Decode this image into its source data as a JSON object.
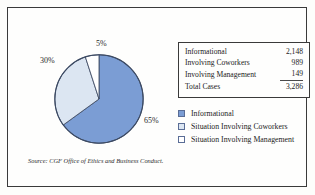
{
  "figure": {
    "source_note": "Source: CGF Office of Ethics and Business Conduct."
  },
  "table": {
    "rows": [
      {
        "label": "Informational",
        "value": "2,148"
      },
      {
        "label": "Involving Coworkers",
        "value": "989"
      },
      {
        "label": "Involving Management",
        "value": "149"
      }
    ],
    "total": {
      "label": "Total Cases",
      "value": "3,286"
    }
  },
  "legend": {
    "items": [
      {
        "label": "Informational",
        "color": "#7B9DD4"
      },
      {
        "label": "Situation Involving Coworkers",
        "color": "#DCE6F2"
      },
      {
        "label": "Situation Involving Management",
        "color": "#FFFFFF"
      }
    ]
  },
  "chart_data": {
    "type": "pie",
    "title": "",
    "categories": [
      "Informational",
      "Situation Involving Coworkers",
      "Situation Involving Management"
    ],
    "values": [
      65,
      30,
      5
    ],
    "value_labels": [
      "65%",
      "30%",
      "5%"
    ],
    "counts": [
      2148,
      989,
      149
    ],
    "total": 3286,
    "colors": [
      "#7B9DD4",
      "#DCE6F2",
      "#FFFFFF"
    ],
    "stroke": "#3C4A63",
    "legend_position": "right",
    "grid": false,
    "start_angle_deg": 0,
    "direction": "clockwise"
  }
}
